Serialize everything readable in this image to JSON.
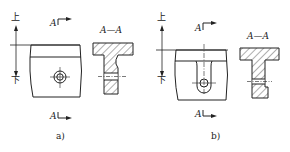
{
  "figures": [
    {
      "id": "a",
      "caption": "a)",
      "up_label": "上",
      "down_label": "下",
      "section_marker_top": "A",
      "section_marker_bottom": "A",
      "section_title": "A—A",
      "feature": "counterbored-hole"
    },
    {
      "id": "b",
      "caption": "b)",
      "up_label": "上",
      "down_label": "下",
      "section_marker_top": "A",
      "section_marker_bottom": "A",
      "section_title": "A—A",
      "feature": "slot-with-hole"
    }
  ],
  "colors": {
    "line": "#222222",
    "background": "#ffffff"
  }
}
